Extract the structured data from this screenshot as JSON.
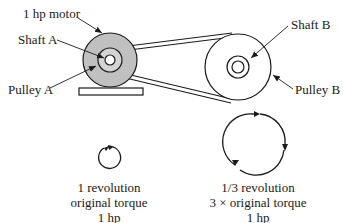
{
  "diagram": {
    "type": "belt-drive pulley system",
    "labels": {
      "motor": "1 hp motor",
      "shaft_a": "Shaft A",
      "pulley_a": "Pulley A",
      "shaft_b": "Shaft B",
      "pulley_b": "Pulley B"
    },
    "colors": {
      "pulley_a_fill": "#c0c0c0",
      "stroke": "#1a1a1a"
    },
    "captions": {
      "left": {
        "line1": "1 revolution",
        "line2": "original torque",
        "line3": "1 hp"
      },
      "right": {
        "line1": "1/3 revolution",
        "line2": "3 × original torque",
        "line3": "1 hp"
      }
    }
  }
}
